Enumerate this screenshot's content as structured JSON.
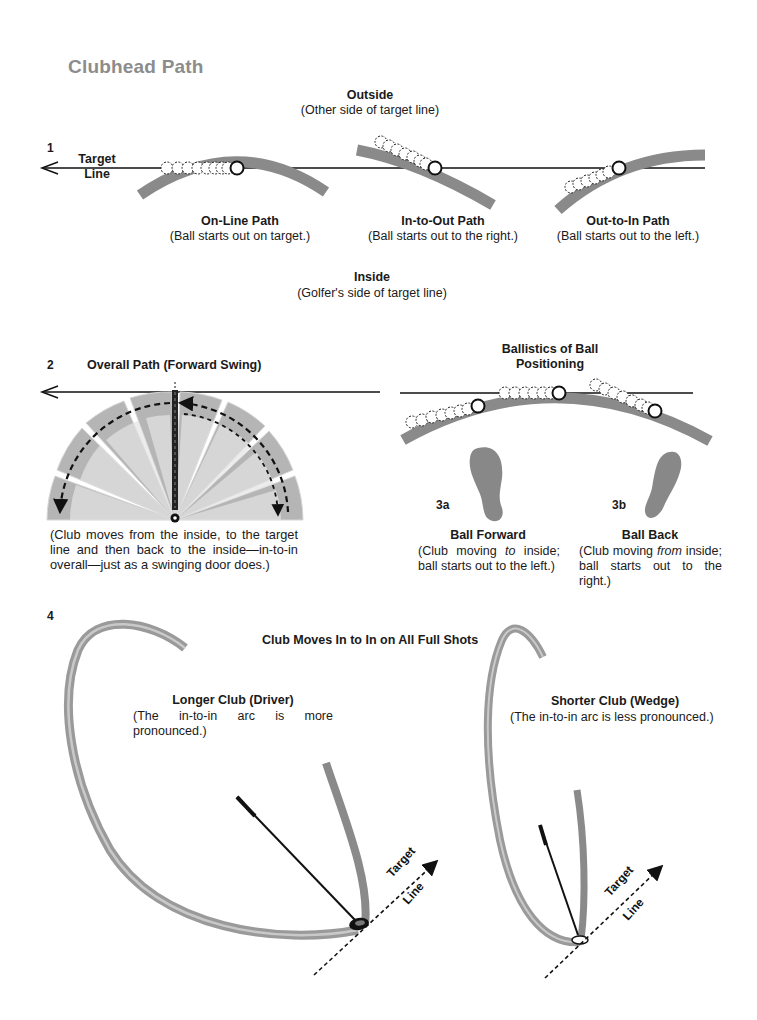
{
  "page": {
    "title": "Clubhead Path"
  },
  "figure1": {
    "number": "1",
    "target_line_label_1": "Target",
    "target_line_label_2": "Line",
    "outside_label": "Outside",
    "outside_sub": "(Other side of target line)",
    "inside_label": "Inside",
    "inside_sub": "(Golfer's side of target line)",
    "paths": [
      {
        "title": "On-Line Path",
        "caption": "(Ball starts out on target.)"
      },
      {
        "title": "In-to-Out Path",
        "caption": "(Ball starts out to the right.)"
      },
      {
        "title": "Out-to-In Path",
        "caption": "(Ball starts out to the left.)"
      }
    ]
  },
  "figure2": {
    "number": "2",
    "title": "Overall Path (Forward Swing)",
    "caption": "(Club moves from the inside, to the target line and then back to the inside—in-to-in overall—just as a swinging door does.)"
  },
  "figure3": {
    "title_line1": "Ballistics of Ball",
    "title_line2": "Positioning",
    "a": {
      "number": "3a",
      "title": "Ball Forward",
      "caption_pre": "(Club moving ",
      "caption_em": "to",
      "caption_post": " inside; ball starts out to the left.)"
    },
    "b": {
      "number": "3b",
      "title": "Ball Back",
      "caption_pre": "(Club moving ",
      "caption_em": "from",
      "caption_post": " inside; ball starts out to the right.)"
    }
  },
  "figure4": {
    "number": "4",
    "title": "Club Moves In to In on All Full Shots",
    "driver": {
      "title": "Longer Club (Driver)",
      "caption": "(The in-to-in arc is more pronounced.)"
    },
    "wedge": {
      "title": "Shorter Club (Wedge)",
      "caption": "(The in-to-in arc is less pronounced.)"
    },
    "target_label": "Target",
    "line_label": "Line"
  },
  "colors": {
    "arc_gray": "#8a8a8a",
    "title_gray": "#8c8c8c",
    "ink": "#1a1a1a"
  }
}
